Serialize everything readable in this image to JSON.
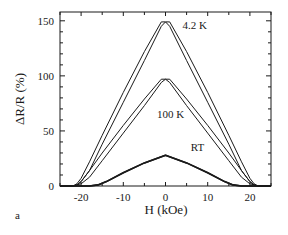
{
  "chart_data": {
    "type": "line",
    "title": "",
    "panel_label": "a",
    "xlabel": "H (kOe)",
    "ylabel": "ΔR/R  (%)",
    "xlim": [
      -25,
      25
    ],
    "ylim": [
      0,
      158
    ],
    "xticks": [
      -20,
      -10,
      0,
      10,
      20
    ],
    "xtick_labels": [
      "-20",
      "-10",
      "0",
      "10",
      "20"
    ],
    "yticks": [
      0,
      50,
      100,
      150
    ],
    "ytick_labels": [
      "0",
      "50",
      "100",
      "150"
    ],
    "grid": false,
    "legend": "inline curve labels",
    "series": [
      {
        "name": "4.2 K",
        "label_pos": {
          "x": 4,
          "y": 143
        },
        "peak": 149,
        "branches": [
          {
            "x": [
              -25,
              -22,
              -21,
              -20,
              -18,
              -15,
              -10,
              -5,
              -1,
              0,
              1,
              5,
              10,
              15,
              18,
              20,
              21,
              22,
              25
            ],
            "y": [
              0,
              0,
              2,
              7,
              22,
              46,
              85,
              122,
              149,
              149,
              145,
              114,
              76,
              38,
              14,
              4,
              1,
              0,
              0
            ]
          },
          {
            "x": [
              -25,
              -22,
              -21,
              -20,
              -18,
              -15,
              -10,
              -5,
              -1,
              0,
              1,
              5,
              10,
              15,
              18,
              20,
              21,
              22,
              25
            ],
            "y": [
              0,
              0,
              1,
              4,
              14,
              38,
              76,
              114,
              145,
              149,
              149,
              122,
              85,
              46,
              22,
              7,
              2,
              0,
              0
            ]
          }
        ]
      },
      {
        "name": "100 K",
        "label_pos": {
          "x": -2,
          "y": 62
        },
        "peak": 97,
        "branches": [
          {
            "x": [
              -25,
              -22,
              -21,
              -20,
              -18,
              -15,
              -10,
              -5,
              -1,
              0,
              1,
              5,
              10,
              15,
              18,
              20,
              21,
              22,
              25
            ],
            "y": [
              0,
              0,
              1,
              4,
              14,
              30,
              55,
              79,
              97,
              97,
              94,
              73,
              48,
              23,
              8,
              2,
              1,
              0,
              0
            ]
          },
          {
            "x": [
              -25,
              -22,
              -21,
              -20,
              -18,
              -15,
              -10,
              -5,
              -1,
              0,
              1,
              5,
              10,
              15,
              18,
              20,
              21,
              22,
              25
            ],
            "y": [
              0,
              0,
              1,
              2,
              8,
              23,
              48,
              73,
              94,
              97,
              97,
              79,
              55,
              30,
              14,
              4,
              1,
              0,
              0
            ]
          }
        ]
      },
      {
        "name": "RT",
        "label_pos": {
          "x": 6,
          "y": 32
        },
        "peak": 28,
        "branches": [
          {
            "x": [
              -25,
              -18,
              -16,
              -14,
              -10,
              -5,
              0,
              5,
              10,
              14,
              16,
              18,
              25
            ],
            "y": [
              0,
              0,
              1,
              4,
              12,
              21,
              28,
              21,
              12,
              4,
              1,
              0,
              0
            ]
          },
          {
            "x": [
              -25,
              -18,
              -16,
              -14,
              -10,
              -5,
              0,
              5,
              10,
              14,
              16,
              18,
              25
            ],
            "y": [
              0,
              0,
              1,
              4,
              12,
              21,
              28,
              21,
              12,
              4,
              1,
              0,
              0
            ]
          }
        ]
      }
    ]
  }
}
